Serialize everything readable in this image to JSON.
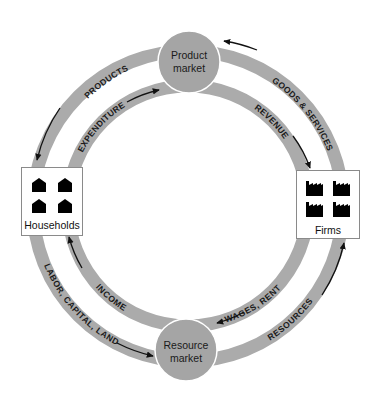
{
  "diagram": {
    "nodes": {
      "product_market": {
        "line1": "Product",
        "line2": "market"
      },
      "resource_market": {
        "line1": "Resource",
        "line2": "market"
      },
      "households": {
        "label": "Households",
        "icon": "house-icon",
        "icon_count": 4
      },
      "firms": {
        "label": "Firms",
        "icon": "factory-icon",
        "icon_count": 4
      }
    },
    "flows": {
      "products": "PRODUCTS",
      "goods_services": "GOODS & SERVICES",
      "expenditure": "EXPENDITURE",
      "revenue": "REVENUE",
      "income": "INCOME",
      "wages_rent": "WAGES, RENT",
      "labor_capital_land": "LABOR, CAPITAL, LAND",
      "resources": "RESOURCES"
    },
    "colors": {
      "ring": "#ababab",
      "market_circle": "#a5a5a5",
      "text": "#1a1a1a",
      "arrow": "#111111"
    }
  }
}
